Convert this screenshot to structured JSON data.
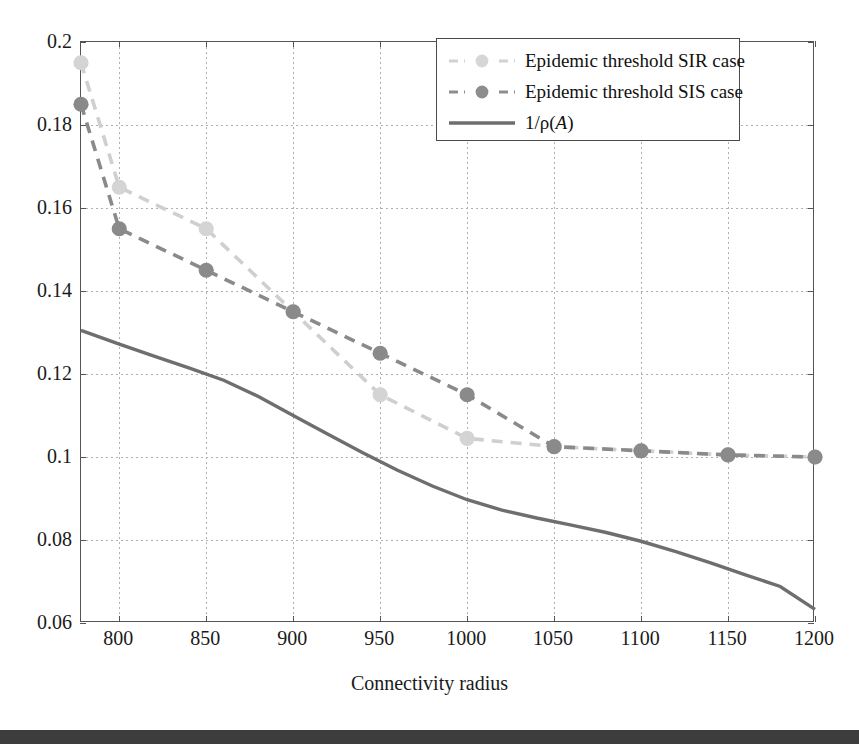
{
  "chart_data": {
    "type": "line",
    "title": "",
    "xlabel": "Connectivity radius",
    "ylabel": "",
    "xlim": [
      778,
      1200
    ],
    "ylim": [
      0.06,
      0.2
    ],
    "xticks": [
      800,
      850,
      900,
      950,
      1000,
      1050,
      1100,
      1150,
      1200
    ],
    "xticklabels": [
      "800",
      "850",
      "900",
      "950",
      "1000",
      "1050",
      "1100",
      "1150",
      "1200"
    ],
    "yticks": [
      0.06,
      0.08,
      0.1,
      0.12,
      0.14,
      0.16,
      0.18,
      0.2
    ],
    "yticklabels": [
      "0.06",
      "0.08",
      "0.1",
      "0.12",
      "0.14",
      "0.16",
      "0.18",
      "0.2"
    ],
    "grid": true,
    "legend_position": "top-right",
    "series": [
      {
        "name": "Epidemic threshold SIR case",
        "style": "dashed-marker",
        "color": "#cfcfcf",
        "x": [
          778,
          800,
          850,
          900,
          950,
          1000,
          1050,
          1100,
          1150,
          1200
        ],
        "values": [
          0.195,
          0.165,
          0.155,
          0.135,
          0.115,
          0.1045,
          0.1025,
          0.1015,
          0.1005,
          0.1
        ]
      },
      {
        "name": "Epidemic threshold SIS case",
        "style": "dashed-marker",
        "color": "#8a8a8a",
        "x": [
          778,
          800,
          850,
          900,
          950,
          1000,
          1050,
          1100,
          1150,
          1200
        ],
        "values": [
          0.185,
          0.155,
          0.145,
          0.135,
          0.125,
          0.115,
          0.1025,
          0.1015,
          0.1005,
          0.1
        ]
      },
      {
        "name": "1/ρ(A)",
        "style": "solid",
        "color": "#6e6e6e",
        "x": [
          778,
          800,
          820,
          840,
          860,
          880,
          900,
          920,
          940,
          960,
          980,
          1000,
          1020,
          1040,
          1060,
          1080,
          1100,
          1120,
          1140,
          1160,
          1180,
          1200
        ],
        "values": [
          0.1305,
          0.1272,
          0.1243,
          0.1215,
          0.1185,
          0.1146,
          0.11,
          0.1055,
          0.101,
          0.0968,
          0.093,
          0.0897,
          0.0872,
          0.0853,
          0.0836,
          0.0818,
          0.0797,
          0.0772,
          0.0745,
          0.0716,
          0.0688,
          0.0633
        ]
      }
    ]
  },
  "legend": {
    "items": [
      {
        "label": "Epidemic threshold SIR case",
        "color": "#cfcfcf",
        "style": "dashed-marker"
      },
      {
        "label": "Epidemic threshold SIS case",
        "color": "#8a8a8a",
        "style": "dashed-marker"
      },
      {
        "label": "1/ρ(A)",
        "color": "#6e6e6e",
        "style": "solid"
      }
    ],
    "third_label_prefix": "1/ρ(",
    "third_label_italic": "A",
    "third_label_suffix": ")"
  },
  "axes": {
    "x_title": "Connectivity radius"
  }
}
